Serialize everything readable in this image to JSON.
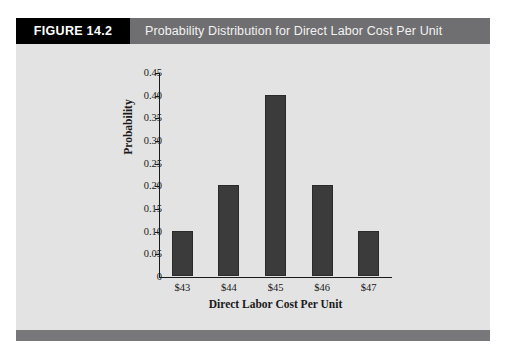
{
  "figure": {
    "tag_label": "FIGURE 14.2",
    "title": "Probability Distribution for Direct Labor Cost Per Unit",
    "tag_background": "#000000",
    "header_background": "#6f6f71",
    "panel_background": "#e3e3e3",
    "footer_background": "#78787b"
  },
  "chart_data": {
    "type": "bar",
    "title": "Probability Distribution for Direct Labor Cost Per Unit",
    "categories": [
      "$43",
      "$44",
      "$45",
      "$46",
      "$47"
    ],
    "values": [
      0.1,
      0.2,
      0.4,
      0.2,
      0.1
    ],
    "xlabel": "Direct Labor Cost Per Unit",
    "ylabel": "Probability",
    "ylim": [
      0,
      0.45
    ],
    "ytick_labels": [
      "0.45",
      "0.40",
      "0.35",
      "0.30",
      "0.25",
      "0.20",
      "0.15",
      "0.10",
      "0.05",
      "0"
    ],
    "ytick_values": [
      0.45,
      0.4,
      0.35,
      0.3,
      0.25,
      0.2,
      0.15,
      0.1,
      0.05,
      0
    ],
    "grid": false,
    "legend": null,
    "bar_color": "#3b3b3b",
    "axis_color": "#1a1a1a",
    "plot_background": "#e3e3e3"
  }
}
